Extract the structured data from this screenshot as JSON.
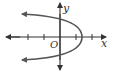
{
  "diagram": {
    "type": "coordinate-plane-graph",
    "labels": {
      "x_axis": "x",
      "y_axis": "y",
      "origin": "O"
    },
    "colors": {
      "axis": "#333333",
      "curve": "#555555",
      "background": "#ffffff"
    },
    "axes": {
      "x_ticks": [
        -2,
        -1,
        1,
        2
      ],
      "y_ticks": []
    },
    "curve": {
      "kind": "parabola",
      "opens": "left",
      "vertex_approx": [
        1.4,
        0
      ],
      "y_intercepts_approx": [
        1,
        -1
      ],
      "ends_with_arrows": true
    }
  }
}
